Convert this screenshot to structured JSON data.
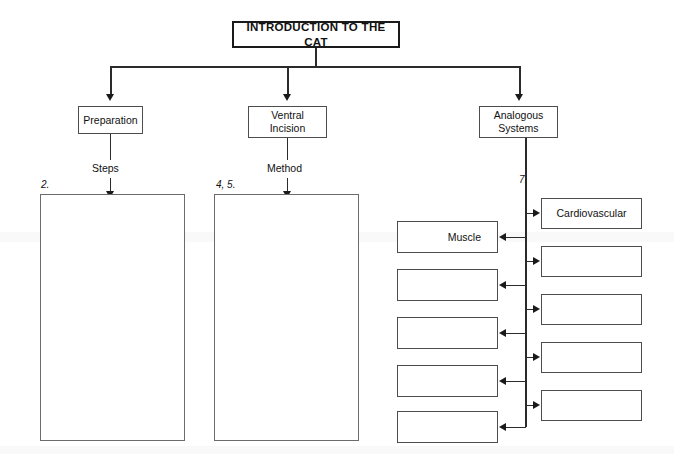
{
  "document": {
    "kind": "concept-map-worksheet",
    "title": "INTRODUCTION TO THE CAT"
  },
  "root": {
    "label": "INTRODUCTION TO THE CAT"
  },
  "branches": [
    {
      "id": "preparation",
      "label": "Preparation",
      "connector_label": "Steps",
      "numeral": "2.",
      "answer_box": ""
    },
    {
      "id": "ventral-incision",
      "label": "Ventral\nIncision",
      "label_line1": "Ventral",
      "label_line2": "Incision",
      "connector_label": "Method",
      "numeral": "4, 5.",
      "answer_box": ""
    },
    {
      "id": "analogous-systems",
      "label": "Analogous\nSystems",
      "label_line1": "Analogous",
      "label_line2": "Systems",
      "numeral": "7."
    }
  ],
  "systems": {
    "left_column": [
      {
        "label": "Muscle"
      },
      {
        "label": ""
      },
      {
        "label": ""
      },
      {
        "label": ""
      },
      {
        "label": ""
      }
    ],
    "right_column": [
      {
        "label": "Cardiovascular"
      },
      {
        "label": ""
      },
      {
        "label": ""
      },
      {
        "label": ""
      },
      {
        "label": ""
      }
    ]
  },
  "colors": {
    "page_background": "#ffffff",
    "box_border": "#4d4d4d",
    "title_border": "#1a1a1a",
    "connector": "#2b2b2b",
    "text": "#111111"
  }
}
